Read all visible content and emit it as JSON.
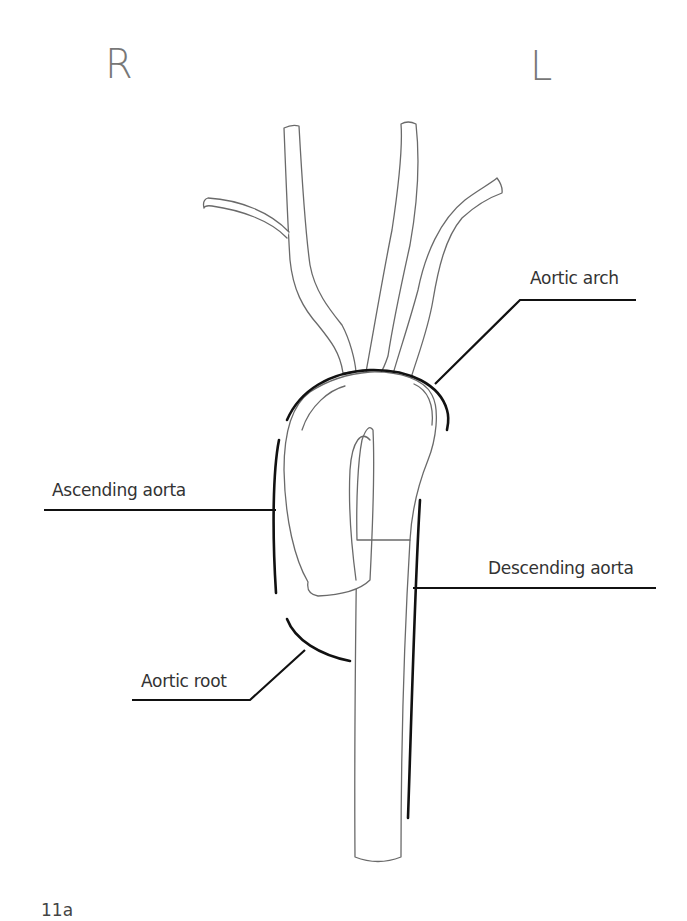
{
  "orientation": {
    "right_marker": "R",
    "left_marker": "L"
  },
  "labels": {
    "aortic_arch": "Aortic arch",
    "ascending_aorta": "Ascending aorta",
    "descending_aorta": "Descending aorta",
    "aortic_root": "Aortic root"
  },
  "figure": {
    "number": "11a"
  },
  "colors": {
    "vessel_outline": "#6a6a6a",
    "leader_line": "#111111",
    "label_text": "#333333",
    "orientation_marker": "#777777",
    "background": "#ffffff"
  }
}
